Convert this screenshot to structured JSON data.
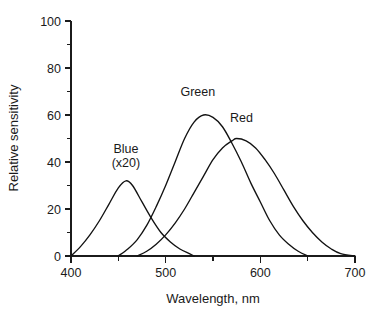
{
  "chart_data": {
    "type": "line",
    "title": "",
    "xlabel": "Wavelength, nm",
    "ylabel": "Relative sensitivity",
    "xlim": [
      400,
      700
    ],
    "ylim": [
      0,
      100
    ],
    "grid": false,
    "legend_position": "inline-annotations",
    "x_ticks_major": [
      400,
      500,
      600,
      700
    ],
    "x_ticks_minor": [
      450,
      550,
      650
    ],
    "x_tick_labels": [
      "400",
      "500",
      "600",
      "700"
    ],
    "y_ticks_major": [
      0,
      20,
      40,
      60,
      80,
      100
    ],
    "y_ticks_minor": [
      10,
      30,
      50,
      70,
      90
    ],
    "y_tick_labels": [
      "0",
      "20",
      "40",
      "60",
      "80",
      "100"
    ],
    "annotations": [
      {
        "text": "Blue",
        "sub": "(x20)",
        "x": 458,
        "y": 44
      },
      {
        "text": "Green",
        "sub": "",
        "x": 534,
        "y": 68
      },
      {
        "text": "Red",
        "sub": "",
        "x": 580,
        "y": 57
      }
    ],
    "series": [
      {
        "name": "Blue",
        "note": "(x20)",
        "peak_x": 458,
        "peak_y": 32,
        "x": [
          400,
          410,
          420,
          430,
          440,
          450,
          458,
          465,
          475,
          485,
          495,
          505,
          515,
          525,
          530
        ],
        "values": [
          0,
          4,
          9,
          15,
          22,
          29,
          32,
          30,
          23,
          16,
          10,
          6,
          3,
          1,
          0
        ]
      },
      {
        "name": "Green",
        "note": "",
        "peak_x": 540,
        "peak_y": 60,
        "x": [
          450,
          460,
          470,
          480,
          490,
          500,
          510,
          520,
          530,
          540,
          550,
          560,
          570,
          580,
          590,
          600,
          610,
          620,
          630,
          640,
          650
        ],
        "values": [
          0,
          3,
          7,
          13,
          21,
          30,
          40,
          50,
          57,
          60,
          59,
          55,
          48,
          40,
          31,
          23,
          15,
          9,
          5,
          2,
          0
        ]
      },
      {
        "name": "Red",
        "note": "",
        "peak_x": 575,
        "peak_y": 50,
        "x": [
          470,
          480,
          490,
          500,
          510,
          520,
          530,
          540,
          550,
          560,
          570,
          575,
          585,
          595,
          605,
          615,
          625,
          635,
          645,
          655,
          665,
          675,
          685,
          700
        ],
        "values": [
          0,
          2,
          5,
          9,
          14,
          20,
          27,
          34,
          41,
          46,
          49,
          50,
          49,
          46,
          41,
          35,
          28,
          21,
          15,
          10,
          6,
          3,
          1,
          0
        ]
      }
    ]
  }
}
